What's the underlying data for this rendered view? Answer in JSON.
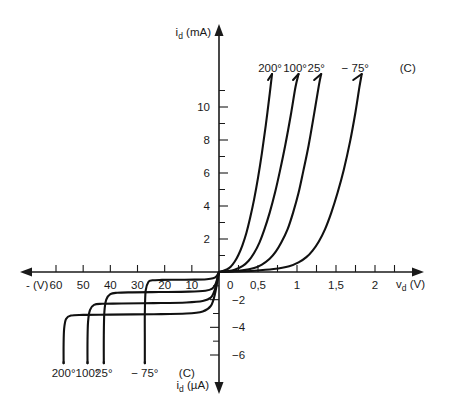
{
  "chart_data": {
    "type": "line",
    "title": "",
    "subtitle": "",
    "quadrants": {
      "forward": {
        "xlabel": "v_d (V)",
        "ylabel": "i_d (mA)",
        "xlim": [
          0,
          2.25
        ],
        "ylim": [
          0,
          12
        ],
        "xticks": [
          0,
          0.25,
          0.5,
          0.75,
          1,
          1.25,
          1.5,
          1.75,
          2
        ],
        "xtick_labels": [
          "0",
          "",
          "0,5",
          "",
          "1",
          "",
          "1,5",
          "",
          "2"
        ],
        "yticks": [
          0,
          1,
          2,
          3,
          4,
          5,
          6,
          7,
          8,
          9,
          10,
          11
        ],
        "ytick_labels": [
          "",
          "",
          "2",
          "",
          "4",
          "",
          "6",
          "",
          "8",
          "",
          "10",
          ""
        ]
      },
      "reverse": {
        "xlabel": "- (V)",
        "ylabel": "i_d (µA)",
        "xlim": [
          0,
          65
        ],
        "ylim": [
          0,
          7
        ],
        "xticks": [
          0,
          10,
          20,
          30,
          40,
          50,
          60
        ],
        "xtick_labels": [
          "0",
          "10",
          "20",
          "30",
          "40",
          "50",
          "60"
        ],
        "yticks": [
          0,
          1,
          2,
          3,
          4,
          5,
          6
        ],
        "ytick_labels": [
          "",
          "",
          "−2",
          "",
          "−4",
          "",
          "−6"
        ]
      }
    },
    "grid": false,
    "legend": "inline-labels",
    "temperature_unit_label": "(C)",
    "series": [
      {
        "name": "200°",
        "label_top": "200°",
        "label_bottom": "200°",
        "forward_knee_v": 0.1,
        "forward_points": [
          [
            0.0,
            0.0
          ],
          [
            0.05,
            0.06
          ],
          [
            0.1,
            0.15
          ],
          [
            0.15,
            0.32
          ],
          [
            0.2,
            0.62
          ],
          [
            0.25,
            1.05
          ],
          [
            0.3,
            1.62
          ],
          [
            0.35,
            2.35
          ],
          [
            0.4,
            3.3
          ],
          [
            0.45,
            4.4
          ],
          [
            0.5,
            5.7
          ],
          [
            0.55,
            7.2
          ],
          [
            0.6,
            8.9
          ],
          [
            0.65,
            10.8
          ],
          [
            0.68,
            12.0
          ]
        ],
        "reverse_saturation_ua": 3.05,
        "breakdown_v": 57,
        "reverse_points": [
          [
            0.0,
            0.0
          ],
          [
            1.5,
            1.6
          ],
          [
            3.0,
            2.45
          ],
          [
            6.0,
            2.85
          ],
          [
            12.0,
            3.0
          ],
          [
            24.0,
            3.05
          ],
          [
            40.0,
            3.08
          ],
          [
            50.0,
            3.1
          ],
          [
            54.5,
            3.15
          ],
          [
            56.3,
            3.4
          ],
          [
            57.0,
            4.1
          ],
          [
            57.2,
            5.2
          ],
          [
            57.2,
            6.6
          ]
        ]
      },
      {
        "name": "100°",
        "label_top": "100°",
        "label_bottom": "100°",
        "forward_knee_v": 0.3,
        "forward_points": [
          [
            0.0,
            0.0
          ],
          [
            0.1,
            0.05
          ],
          [
            0.2,
            0.14
          ],
          [
            0.3,
            0.35
          ],
          [
            0.38,
            0.68
          ],
          [
            0.45,
            1.15
          ],
          [
            0.52,
            1.8
          ],
          [
            0.58,
            2.55
          ],
          [
            0.65,
            3.6
          ],
          [
            0.72,
            4.85
          ],
          [
            0.78,
            6.1
          ],
          [
            0.85,
            7.7
          ],
          [
            0.92,
            9.5
          ],
          [
            0.98,
            11.2
          ],
          [
            1.02,
            12.0
          ]
        ],
        "reverse_saturation_ua": 2.25,
        "breakdown_v": 48,
        "reverse_points": [
          [
            0.0,
            0.0
          ],
          [
            1.5,
            1.25
          ],
          [
            3.0,
            1.85
          ],
          [
            6.0,
            2.1
          ],
          [
            12.0,
            2.2
          ],
          [
            24.0,
            2.25
          ],
          [
            36.0,
            2.28
          ],
          [
            43.0,
            2.3
          ],
          [
            46.0,
            2.38
          ],
          [
            47.5,
            2.75
          ],
          [
            48.2,
            3.6
          ],
          [
            48.4,
            5.0
          ],
          [
            48.4,
            6.6
          ]
        ]
      },
      {
        "name": "25°",
        "label_top": "25°",
        "label_bottom": "25°",
        "forward_knee_v": 0.5,
        "forward_points": [
          [
            0.0,
            0.0
          ],
          [
            0.15,
            0.04
          ],
          [
            0.3,
            0.1
          ],
          [
            0.45,
            0.24
          ],
          [
            0.55,
            0.45
          ],
          [
            0.65,
            0.8
          ],
          [
            0.73,
            1.25
          ],
          [
            0.8,
            1.8
          ],
          [
            0.88,
            2.6
          ],
          [
            0.95,
            3.6
          ],
          [
            1.02,
            4.8
          ],
          [
            1.08,
            6.1
          ],
          [
            1.15,
            7.7
          ],
          [
            1.22,
            9.6
          ],
          [
            1.28,
            11.3
          ],
          [
            1.31,
            12.0
          ]
        ],
        "reverse_saturation_ua": 1.45,
        "breakdown_v": 42,
        "reverse_points": [
          [
            0.0,
            0.0
          ],
          [
            1.2,
            0.85
          ],
          [
            2.5,
            1.2
          ],
          [
            5.0,
            1.35
          ],
          [
            11.0,
            1.42
          ],
          [
            22.0,
            1.45
          ],
          [
            32.0,
            1.47
          ],
          [
            37.5,
            1.5
          ],
          [
            40.0,
            1.6
          ],
          [
            41.5,
            2.0
          ],
          [
            42.2,
            2.9
          ],
          [
            42.4,
            4.6
          ],
          [
            42.4,
            6.6
          ]
        ]
      },
      {
        "name": "−75°",
        "label_top": "− 75°",
        "label_bottom": "− 75°",
        "forward_knee_v": 0.9,
        "forward_points": [
          [
            0.0,
            0.0
          ],
          [
            0.2,
            0.03
          ],
          [
            0.45,
            0.08
          ],
          [
            0.7,
            0.18
          ],
          [
            0.9,
            0.35
          ],
          [
            1.02,
            0.58
          ],
          [
            1.12,
            0.9
          ],
          [
            1.2,
            1.3
          ],
          [
            1.28,
            1.85
          ],
          [
            1.36,
            2.6
          ],
          [
            1.44,
            3.6
          ],
          [
            1.52,
            4.8
          ],
          [
            1.6,
            6.2
          ],
          [
            1.68,
            7.9
          ],
          [
            1.75,
            9.7
          ],
          [
            1.8,
            11.2
          ],
          [
            1.83,
            12.0
          ]
        ],
        "reverse_saturation_ua": 0.55,
        "breakdown_v": 27,
        "reverse_points": [
          [
            0.0,
            0.0
          ],
          [
            1.0,
            0.32
          ],
          [
            2.2,
            0.46
          ],
          [
            4.5,
            0.52
          ],
          [
            9.0,
            0.55
          ],
          [
            16.0,
            0.56
          ],
          [
            21.0,
            0.57
          ],
          [
            24.5,
            0.6
          ],
          [
            26.0,
            0.72
          ],
          [
            27.0,
            1.35
          ],
          [
            27.3,
            3.0
          ],
          [
            27.3,
            5.0
          ],
          [
            27.3,
            6.6
          ]
        ]
      }
    ],
    "top_labels": {
      "items": [
        "200°",
        "100°",
        "25°",
        "− 75°"
      ],
      "unit": "(C)"
    },
    "bottom_labels": {
      "items": [
        "200°",
        "100°",
        "25°",
        "− 75°"
      ],
      "unit": "(C)"
    },
    "colors": {
      "curve": "#111111",
      "axis": "#1a1a1a",
      "text": "#1a1a1a",
      "background": "#ffffff"
    }
  },
  "axes": {
    "y_top_label_main": "i",
    "y_top_label_sub": "d",
    "y_top_label_unit": "(mA)",
    "y_bottom_label_main": "i",
    "y_bottom_label_sub": "d",
    "y_bottom_label_unit": "(µA)",
    "x_right_label_main": "v",
    "x_right_label_sub": "d",
    "x_right_label_unit": "(V)",
    "x_left_label": "- (V)"
  },
  "x_neg_ticks": [
    {
      "value": 60,
      "label": "60"
    },
    {
      "value": 50,
      "label": "50"
    },
    {
      "value": 40,
      "label": "40"
    },
    {
      "value": 30,
      "label": "30"
    },
    {
      "value": 20,
      "label": "20"
    },
    {
      "value": 10,
      "label": "10"
    }
  ],
  "x_pos_ticks": [
    {
      "value": 0,
      "label": "0"
    },
    {
      "value": 0.5,
      "label": "0,5"
    },
    {
      "value": 1,
      "label": "1"
    },
    {
      "value": 1.5,
      "label": "1,5"
    },
    {
      "value": 2,
      "label": "2"
    }
  ],
  "y_pos_ticks": [
    {
      "value": 2,
      "label": "2"
    },
    {
      "value": 4,
      "label": "4"
    },
    {
      "value": 6,
      "label": "6"
    },
    {
      "value": 8,
      "label": "8"
    },
    {
      "value": 10,
      "label": "10"
    }
  ],
  "y_neg_ticks": [
    {
      "value": 2,
      "label": "−2"
    },
    {
      "value": 4,
      "label": "−4"
    },
    {
      "value": 6,
      "label": "−6"
    }
  ]
}
